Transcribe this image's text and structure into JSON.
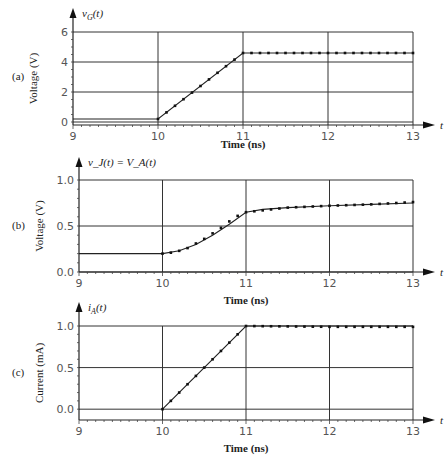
{
  "chart_data": [
    {
      "panel": "(a)",
      "type": "line",
      "title": "v_G(t)",
      "xlabel": "Time (ns)",
      "ylabel": "Voltage (V)",
      "axis_arrow_label": "t",
      "x_ticks": [
        9,
        10,
        11,
        12,
        13
      ],
      "y_ticks": [
        0,
        2,
        4,
        6
      ],
      "y_tick_labels": [
        "0",
        "2",
        "4",
        "6"
      ],
      "xlim": [
        9,
        13
      ],
      "ylim": [
        0,
        6
      ],
      "grid": true,
      "series": [
        {
          "name": "v_G (line)",
          "style": "solid",
          "x": [
            9,
            10,
            11,
            12,
            13
          ],
          "y": [
            0.2,
            0.2,
            4.6,
            4.6,
            4.6
          ]
        },
        {
          "name": "v_G (markers)",
          "style": "dotted",
          "x": [
            10,
            10.1,
            10.2,
            10.3,
            10.4,
            10.5,
            10.6,
            10.7,
            10.8,
            10.9,
            11,
            12,
            13
          ],
          "y": [
            0.2,
            0.64,
            1.08,
            1.52,
            1.96,
            2.4,
            2.84,
            3.28,
            3.72,
            4.16,
            4.6,
            4.6,
            4.6
          ]
        }
      ]
    },
    {
      "panel": "(b)",
      "type": "line",
      "title": "v_J(t) = V_A(t)",
      "xlabel": "Time (ns)",
      "ylabel": "Voltage (V)",
      "axis_arrow_label": "t",
      "x_ticks": [
        9,
        10,
        11,
        12,
        13
      ],
      "y_ticks": [
        0.0,
        0.5,
        1.0
      ],
      "y_tick_labels": [
        "0.0",
        "0.5",
        "1.0"
      ],
      "xlim": [
        9,
        13
      ],
      "ylim": [
        0,
        1.0
      ],
      "grid": true,
      "series": [
        {
          "name": "v_J (line)",
          "style": "solid",
          "x": [
            9,
            10,
            10.2,
            10.4,
            10.6,
            10.8,
            11,
            11.2,
            11.5,
            12,
            12.5,
            13
          ],
          "y": [
            0.2,
            0.2,
            0.23,
            0.3,
            0.4,
            0.52,
            0.65,
            0.68,
            0.7,
            0.72,
            0.735,
            0.75
          ]
        },
        {
          "name": "v_J (markers)",
          "style": "dotted",
          "x": [
            10,
            10.1,
            10.2,
            10.3,
            10.4,
            10.5,
            10.6,
            10.7,
            10.8,
            10.9,
            11,
            11.5,
            12,
            12.5,
            13
          ],
          "y": [
            0.2,
            0.21,
            0.23,
            0.26,
            0.31,
            0.36,
            0.42,
            0.48,
            0.55,
            0.61,
            0.65,
            0.7,
            0.72,
            0.735,
            0.76
          ]
        }
      ]
    },
    {
      "panel": "(c)",
      "type": "line",
      "title": "i_A(t)",
      "xlabel": "Time (ns)",
      "ylabel": "Current (mA)",
      "axis_arrow_label": "t",
      "x_ticks": [
        9,
        10,
        11,
        12,
        13
      ],
      "y_ticks": [
        0.0,
        0.5,
        1.0
      ],
      "y_tick_labels": [
        "0.0",
        "0.5",
        "1.0"
      ],
      "xlim": [
        9,
        13
      ],
      "ylim": [
        -0.2,
        1.0
      ],
      "grid": true,
      "series": [
        {
          "name": "i_A (line)",
          "style": "solid",
          "x": [
            10,
            11,
            12,
            13
          ],
          "y": [
            0.0,
            1.0,
            1.0,
            1.0
          ]
        },
        {
          "name": "i_A (markers)",
          "style": "dotted",
          "x": [
            10,
            10.1,
            10.2,
            10.3,
            10.4,
            10.5,
            10.6,
            10.7,
            10.8,
            10.9,
            11,
            12,
            13
          ],
          "y": [
            0.0,
            0.1,
            0.2,
            0.3,
            0.4,
            0.5,
            0.6,
            0.7,
            0.8,
            0.9,
            1.0,
            0.99,
            0.99
          ]
        }
      ]
    }
  ],
  "labels": {
    "a": {
      "panel": "(a)",
      "title_var": "v",
      "title_sub": "G",
      "title_rest": "(t)",
      "ylabel": "Voltage (V)",
      "xlabel": "Time (ns)",
      "t": "t",
      "xt": [
        "9",
        "10",
        "11",
        "12",
        "13"
      ],
      "yt": [
        "0",
        "2",
        "4",
        "6"
      ]
    },
    "b": {
      "panel": "(b)",
      "title": "v_J(t) = V_A(t)",
      "ylabel": "Voltage (V)",
      "xlabel": "Time (ns)",
      "t": "t",
      "xt": [
        "9",
        "10",
        "11",
        "12",
        "13"
      ],
      "yt": [
        "0.0",
        "0.5",
        "1.0"
      ]
    },
    "c": {
      "panel": "(c)",
      "title_var": "i",
      "title_sub": "A",
      "title_rest": "(t)",
      "ylabel": "Current (mA)",
      "xlabel": "Time (ns)",
      "t": "t",
      "xt": [
        "9",
        "10",
        "11",
        "12",
        "13"
      ],
      "yt": [
        "0.0",
        "0.5",
        "1.0"
      ]
    }
  }
}
